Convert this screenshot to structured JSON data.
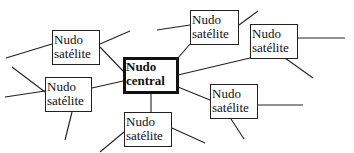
{
  "diagram": {
    "type": "concept-map",
    "colors": {
      "stroke": "#222222",
      "background": "#ffffff",
      "text": "#111111"
    },
    "central": {
      "line1": "Nudo",
      "line2": "central",
      "box": [
        123,
        57,
        56,
        37
      ]
    },
    "satellites": [
      {
        "id": "top-left",
        "line1": "Nudo",
        "line2": "satélite",
        "box": [
          52,
          30,
          48,
          35
        ]
      },
      {
        "id": "top-center",
        "line1": "Nudo",
        "line2": "satélite",
        "box": [
          190,
          10,
          49,
          35
        ]
      },
      {
        "id": "top-right",
        "line1": "Nudo",
        "line2": "satélite",
        "box": [
          250,
          24,
          48,
          35
        ]
      },
      {
        "id": "left",
        "line1": "Nudo",
        "line2": "satélite",
        "box": [
          45,
          77,
          47,
          35
        ]
      },
      {
        "id": "bottom-center",
        "line1": "Nudo",
        "line2": "satélite",
        "box": [
          124,
          112,
          48,
          35
        ]
      },
      {
        "id": "right",
        "line1": "Nudo",
        "line2": "satélite",
        "box": [
          210,
          84,
          48,
          35
        ]
      }
    ],
    "connectors": [
      [
        100,
        47,
        123,
        71
      ],
      [
        92,
        88,
        123,
        81
      ],
      [
        151,
        94,
        151,
        112
      ],
      [
        178,
        87,
        210,
        100
      ],
      [
        178,
        75,
        250,
        58
      ],
      [
        178,
        58,
        190,
        44
      ]
    ],
    "dangling_lines": [
      [
        6,
        58,
        52,
        44
      ],
      [
        100,
        44,
        130,
        31
      ],
      [
        157,
        30,
        190,
        25
      ],
      [
        239,
        25,
        258,
        11
      ],
      [
        298,
        38,
        345,
        38
      ],
      [
        285,
        58,
        313,
        78
      ],
      [
        12,
        67,
        45,
        92
      ],
      [
        5,
        97,
        45,
        91
      ],
      [
        72,
        112,
        65,
        140
      ],
      [
        100,
        152,
        124,
        132
      ],
      [
        172,
        128,
        205,
        143
      ],
      [
        136,
        128,
        160,
        139
      ],
      [
        258,
        105,
        303,
        105
      ],
      [
        231,
        119,
        244,
        139
      ]
    ]
  }
}
